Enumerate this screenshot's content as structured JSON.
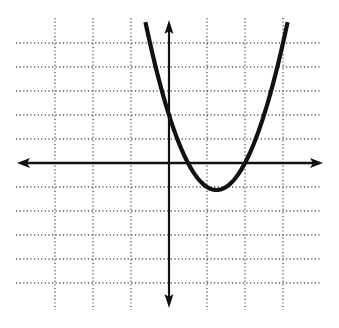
{
  "chart_data": {
    "type": "line",
    "title": "",
    "xlabel": "",
    "ylabel": "",
    "grid": true,
    "grid_style": "dotted",
    "xlim": [
      -4.0,
      4.0
    ],
    "ylim": [
      -6.0,
      6.0
    ],
    "x_gridlines": [
      -3,
      -2,
      -1,
      1,
      2,
      3
    ],
    "y_gridlines": [
      -5,
      -4,
      -3,
      -2,
      -1,
      1,
      2,
      3,
      4,
      5
    ],
    "series": [
      {
        "name": "parabola",
        "equation": "y = 2x^2 - 5x + 2",
        "roots": [
          0.5,
          2
        ],
        "y_intercept": 2,
        "vertex": [
          1.25,
          -1.125
        ],
        "x_range": [
          -0.62,
          3.12
        ],
        "color": "#111111"
      }
    ]
  },
  "colors": {
    "background": "#ffffff",
    "grid": "#555555",
    "axes": "#111111",
    "curve": "#111111"
  },
  "pixel_layout": {
    "origin": [
      169,
      163
    ],
    "x_unit_px": 38,
    "y_unit_px": 24,
    "grid_left": 16,
    "grid_right": 320,
    "grid_top": 18,
    "grid_bottom": 310,
    "x_axis_left_tip": 17,
    "x_axis_right_tip": 323,
    "y_axis_top_tip": 20,
    "y_axis_bottom_tip": 308
  }
}
